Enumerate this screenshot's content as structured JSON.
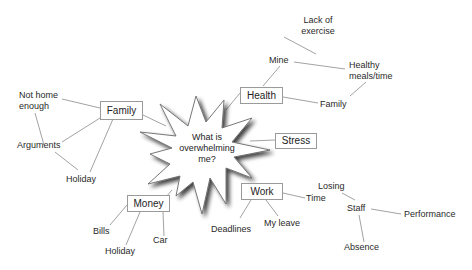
{
  "diagram": {
    "type": "mind-map",
    "center": {
      "line1": "What is",
      "line2": "overwhelming",
      "line3": "me?"
    },
    "branches": {
      "family": {
        "label": "Family",
        "children": {
          "not_home_1": "Not home",
          "not_home_2": "enough",
          "arguments": "Arguments",
          "holiday": "Holiday"
        }
      },
      "health": {
        "label": "Health",
        "children": {
          "mine": "Mine",
          "lack_1": "Lack of",
          "lack_2": "exercise",
          "healthy_1": "Healthy",
          "healthy_2": "meals/time",
          "family": "Family"
        }
      },
      "stress": {
        "label": "Stress"
      },
      "work": {
        "label": "Work",
        "children": {
          "deadlines": "Deadlines",
          "my_leave": "My leave",
          "time": "Time",
          "losing": "Losing",
          "staff": "Staff",
          "performance": "Performance",
          "absence": "Absence"
        }
      },
      "money": {
        "label": "Money",
        "children": {
          "bills": "Bills",
          "holiday": "Holiday",
          "car": "Car"
        }
      }
    },
    "colors": {
      "line": "#8a8a8a",
      "box_border": "#9a9a9a",
      "text": "#222222",
      "star_shadow": "#555555"
    }
  }
}
